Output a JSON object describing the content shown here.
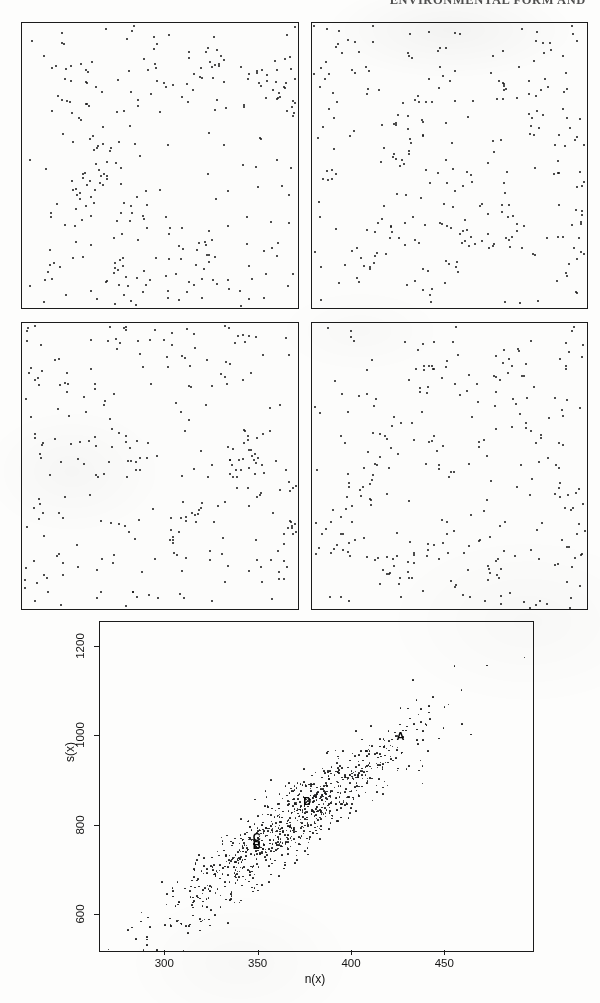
{
  "running_head": "ENVIRONMENTAL FORM AND",
  "panels": [
    {
      "name": "panel-top-left",
      "x": 21,
      "y": 22,
      "width": 276,
      "height": 285,
      "seed": 11,
      "n": 300
    },
    {
      "name": "panel-top-right",
      "x": 311,
      "y": 22,
      "width": 275,
      "height": 285,
      "seed": 29,
      "n": 300
    },
    {
      "name": "panel-bottom-left",
      "x": 21,
      "y": 322,
      "width": 276,
      "height": 286,
      "seed": 53,
      "n": 300
    },
    {
      "name": "panel-bottom-right",
      "x": 311,
      "y": 322,
      "width": 275,
      "height": 286,
      "seed": 71,
      "n": 300
    }
  ],
  "chart_data": {
    "type": "scatter",
    "title": "",
    "xlabel": "n(x)",
    "ylabel": "s(x)",
    "xticks": [
      300,
      350,
      400,
      450
    ],
    "yticks": [
      600,
      800,
      1000,
      1200
    ],
    "xlim": [
      265,
      497
    ],
    "ylim": [
      520,
      1255
    ],
    "grid": false,
    "legend": null,
    "n_points": 900,
    "point_seed": 97,
    "relation": "s(x) increases approximately linearly with n(x); elongated positively correlated cloud",
    "trend": {
      "slope": 3.05,
      "intercept": -310,
      "scatter_sd": 42
    },
    "labeled_points": [
      {
        "label": "A",
        "x": 426,
        "y": 1000
      },
      {
        "label": "D",
        "x": 376,
        "y": 856
      },
      {
        "label": "C",
        "x": 349,
        "y": 775
      },
      {
        "label": "B",
        "x": 349,
        "y": 756
      }
    ]
  }
}
